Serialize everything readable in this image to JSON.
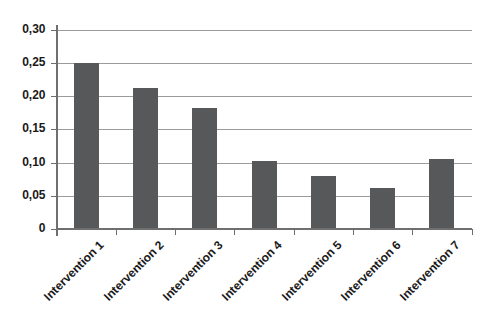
{
  "chart_data": {
    "type": "bar",
    "title": "",
    "xlabel": "",
    "ylabel": "",
    "categories": [
      "Intervention 1",
      "Intervention 2",
      "Intervention 3",
      "Intervention 4",
      "Intervention 5",
      "Intervention 6",
      "Intervention 7"
    ],
    "values": [
      0.25,
      0.212,
      0.182,
      0.102,
      0.08,
      0.061,
      0.105
    ],
    "ylim": [
      0,
      0.3
    ],
    "ytick_step": 0.05,
    "ytick_labels": [
      "0",
      "0,05",
      "0,10",
      "0,15",
      "0,20",
      "0,25",
      "0,30"
    ],
    "grid": true,
    "legend": false,
    "colors": {
      "bar": "#57585a",
      "gridline": "#9b9b9b",
      "axis": "#6f6f6f",
      "text": "#1a1a1a",
      "background": "#ffffff"
    }
  }
}
